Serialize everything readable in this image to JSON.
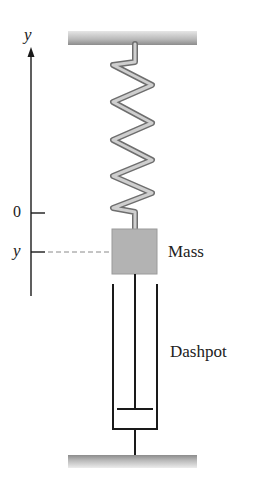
{
  "diagram": {
    "axis": {
      "label": "y",
      "ticks": [
        {
          "label": "0",
          "position": "equilibrium"
        },
        {
          "label": "y",
          "position": "displacement"
        }
      ]
    },
    "components": {
      "ceiling": "fixed support",
      "spring": "spring",
      "mass": {
        "label": "Mass"
      },
      "dashpot": {
        "label": "Dashpot"
      },
      "floor": "fixed support"
    },
    "colors": {
      "line": "#1a1a1a",
      "mass_fill": "#b3b3b3",
      "spring_fill": "#c8c8c8",
      "spring_edge": "#6e6e6e",
      "plate": "#9a9a9a",
      "dashed_line": "#8a8a8a"
    }
  }
}
